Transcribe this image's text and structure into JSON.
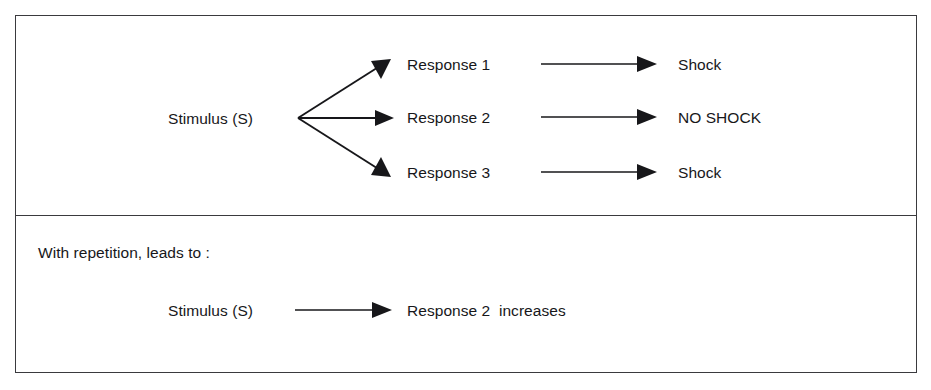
{
  "diagram": {
    "colors": {
      "background": "#ffffff",
      "frame_stroke": "#3a3a3e",
      "arrow_stroke": "#17171a",
      "text": "#17171a"
    },
    "top_panel": {
      "source": {
        "label": "Stimulus (S)"
      },
      "branches": [
        {
          "response": "Response 1",
          "outcome": "Shock"
        },
        {
          "response": "Response 2",
          "outcome": "NO SHOCK"
        },
        {
          "response": "Response 3",
          "outcome": "Shock"
        }
      ]
    },
    "bottom_panel": {
      "note": "With repetition, leads to :",
      "source": {
        "label": "Stimulus (S)"
      },
      "result": "Response 2  increases"
    }
  }
}
